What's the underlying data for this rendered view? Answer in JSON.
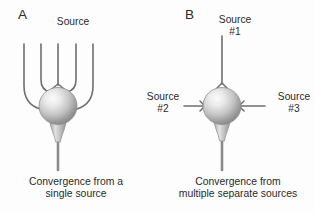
{
  "figure": {
    "type": "diagram",
    "background_color": "#fdfdfd",
    "line_color": "#6e6e6e",
    "soma_fill_light": "#f2f2f2",
    "soma_fill_dark": "#8a8a8a",
    "text_color": "#2a2a2a"
  },
  "panels": [
    {
      "letter": "A",
      "source_label": "Source",
      "caption_line1": "Convergence from a",
      "caption_line2": "single source",
      "branch_count": 5,
      "description": "One source axon branches into five collaterals that all converge on a single neuron soma"
    },
    {
      "letter": "B",
      "sources": [
        {
          "line1": "Source",
          "line2": "#1",
          "position": "top"
        },
        {
          "line1": "Source",
          "line2": "#2",
          "position": "left"
        },
        {
          "line1": "Source",
          "line2": "#3",
          "position": "right"
        }
      ],
      "caption_line1": "Convergence from",
      "caption_line2": "multiple separate sources",
      "branch_count": 3,
      "description": "Three separate source axons converge on a single neuron soma from above, left and right"
    }
  ]
}
